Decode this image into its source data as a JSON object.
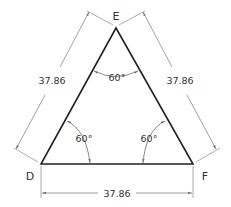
{
  "diagram": {
    "type": "equilateral-triangle",
    "vertices": {
      "top": "E",
      "bottom_left": "D",
      "bottom_right": "F"
    },
    "dimensions": {
      "left_side": "37.86",
      "right_side": "37.86",
      "bottom_side": "37.86"
    },
    "angles": {
      "at_E": "60°",
      "at_D": "60°",
      "at_F": "60°"
    },
    "colors": {
      "triangle": "#222222",
      "dimension_lines": "#777777",
      "text": "#333333",
      "background": "#ffffff"
    }
  }
}
